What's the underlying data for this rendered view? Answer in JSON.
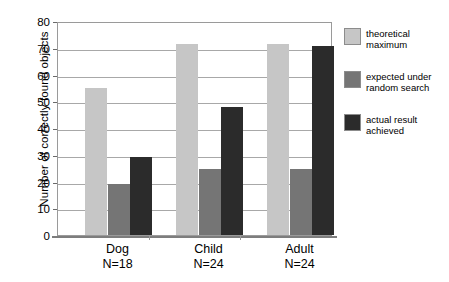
{
  "chart_data": {
    "type": "bar",
    "title": "",
    "subtitle": "",
    "xlabel": "",
    "ylabel": "Number of correctly found objects",
    "ylim": [
      0,
      80
    ],
    "yticks": [
      0,
      10,
      20,
      30,
      40,
      50,
      60,
      70,
      80
    ],
    "ytick_labels": [
      "0",
      "10",
      "20",
      "30",
      "40",
      "50",
      "60",
      "70",
      "80"
    ],
    "grid": "horizontal",
    "legend_position": "right",
    "categories": [
      "Dog",
      "Child",
      "Adult"
    ],
    "category_sublabels": [
      "N=18",
      "N=24",
      "N=24"
    ],
    "series": [
      {
        "name": "theoretical maximum",
        "name_line1": "theoretical",
        "name_line2": "maximum",
        "color": "#c6c6c6",
        "values": [
          55,
          71.5,
          71.5
        ]
      },
      {
        "name": "expected under random search",
        "name_line1": "expected under",
        "name_line2": "random search",
        "color": "#757575",
        "values": [
          19,
          24.5,
          24.5
        ]
      },
      {
        "name": "actual result achieved",
        "name_line1": "actual result",
        "name_line2": "achieved",
        "color": "#2b2b2b",
        "values": [
          29,
          48,
          70.5
        ]
      }
    ]
  },
  "colors": {
    "background": "#ffffff",
    "axis": "#7d7d7d",
    "gridline": "#a8a8a8",
    "plot_border": "#9a9a9a",
    "text": "#000000"
  }
}
